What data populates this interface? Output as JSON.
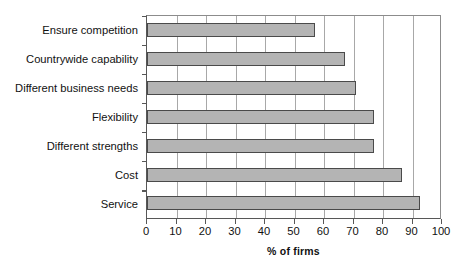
{
  "chart_data": {
    "type": "bar",
    "orientation": "horizontal",
    "title": "",
    "xlabel": "% of firms",
    "ylabel": "",
    "categories": [
      "Ensure competition",
      "Countrywide capability",
      "Different business needs",
      "Flexibility",
      "Different strengths",
      "Cost",
      "Service"
    ],
    "values": [
      57,
      67,
      71,
      77,
      77,
      86.5,
      92.5
    ],
    "xlim": [
      0,
      100
    ],
    "xticks": [
      0,
      10,
      20,
      30,
      40,
      50,
      60,
      70,
      80,
      90,
      100
    ],
    "xtick_labels": [
      "0",
      "10",
      "20",
      "30",
      "40",
      "50",
      "60",
      "70",
      "80",
      "90",
      "100"
    ],
    "grid": "vertical",
    "legend": "none",
    "bar_color": "#b4b4b4",
    "bar_border_color": "#4a4a4a",
    "axis_color": "#575757",
    "gridline_color": "#a8a8a8",
    "background": "#ffffff"
  }
}
